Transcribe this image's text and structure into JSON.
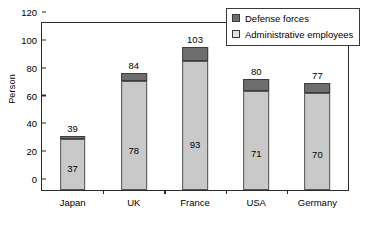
{
  "chart_data": {
    "type": "bar",
    "subtype": "stacked-vertical",
    "title": "",
    "xlabel": "",
    "ylabel": "Person",
    "ylim": [
      0,
      120
    ],
    "yticks": [
      0,
      20,
      40,
      60,
      80,
      100,
      120
    ],
    "grid": false,
    "legend_position": "top-right",
    "categories": [
      "Japan",
      "UK",
      "France",
      "USA",
      "Germany"
    ],
    "series": [
      {
        "name": "Administrative employees",
        "values": [
          37,
          78,
          93,
          71,
          70
        ],
        "color": "#c9c9c9"
      },
      {
        "name": "Defense forces",
        "values": [
          2,
          6,
          10,
          9,
          7
        ],
        "color": "#6e6e6e"
      }
    ],
    "totals": [
      39,
      84,
      103,
      80,
      77
    ],
    "total_labels": [
      "39",
      "84",
      "103",
      "80",
      "77"
    ],
    "admin_labels": [
      "37",
      "78",
      "93",
      "71",
      "70"
    ],
    "tick_labels": [
      "0",
      "20",
      "40",
      "60",
      "80",
      "100",
      "120"
    ]
  },
  "legend": {
    "items": [
      {
        "label": "Defense forces",
        "key": "defense"
      },
      {
        "label": "Administrative employees",
        "key": "admin"
      }
    ]
  },
  "colors": {
    "administrative": "#c9c9c9",
    "defense": "#6e6e6e",
    "axis": "#2b2b2b",
    "background": "#ffffff"
  }
}
